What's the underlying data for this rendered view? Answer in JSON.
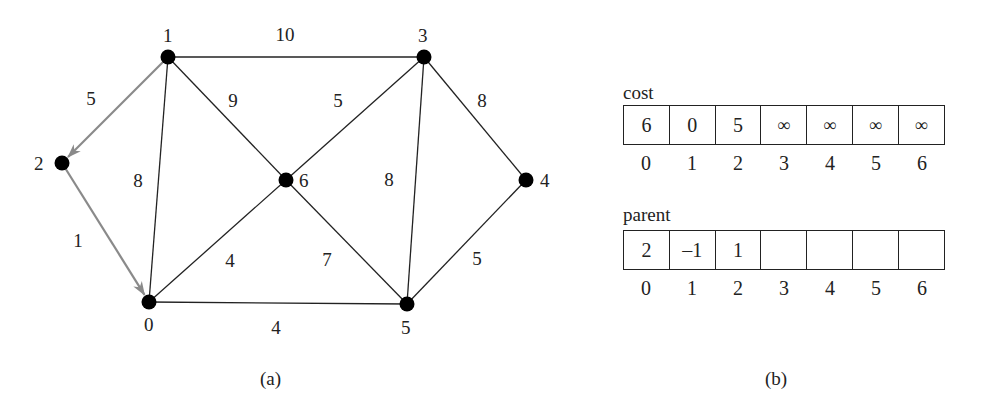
{
  "figure": {
    "part_a": {
      "caption": "(a)",
      "nodes": [
        {
          "id": "0",
          "label": "0",
          "x": 149,
          "y": 302,
          "lx": 144,
          "ly": 331
        },
        {
          "id": "1",
          "label": "1",
          "x": 168,
          "y": 57,
          "lx": 163,
          "ly": 42
        },
        {
          "id": "2",
          "label": "2",
          "x": 62,
          "y": 163,
          "lx": 34,
          "ly": 170
        },
        {
          "id": "3",
          "label": "3",
          "x": 424,
          "y": 57,
          "lx": 418,
          "ly": 42
        },
        {
          "id": "4",
          "label": "4",
          "x": 526,
          "y": 180,
          "lx": 540,
          "ly": 187
        },
        {
          "id": "5",
          "label": "5",
          "x": 407,
          "y": 304,
          "lx": 401,
          "ly": 334
        },
        {
          "id": "6",
          "label": "6",
          "x": 286,
          "y": 180,
          "lx": 299,
          "ly": 187
        }
      ],
      "edges": [
        {
          "from": "1",
          "to": "3",
          "weight": "10",
          "tree": false,
          "wx": 285,
          "wy": 41
        },
        {
          "from": "1",
          "to": "2",
          "weight": "5",
          "tree": true,
          "directed": true,
          "wx": 91,
          "wy": 105
        },
        {
          "from": "1",
          "to": "6",
          "weight": "9",
          "tree": false,
          "wx": 233,
          "wy": 107
        },
        {
          "from": "1",
          "to": "0",
          "weight": "8",
          "tree": false,
          "wx": 138,
          "wy": 187
        },
        {
          "from": "2",
          "to": "0",
          "weight": "1",
          "tree": true,
          "directed": true,
          "wx": 78,
          "wy": 247
        },
        {
          "from": "3",
          "to": "6",
          "weight": "5",
          "tree": false,
          "wx": 338,
          "wy": 107
        },
        {
          "from": "3",
          "to": "5",
          "weight": "8",
          "tree": false,
          "wx": 389,
          "wy": 186
        },
        {
          "from": "3",
          "to": "4",
          "weight": "8",
          "tree": false,
          "wx": 482,
          "wy": 107
        },
        {
          "from": "6",
          "to": "0",
          "weight": "4",
          "tree": false,
          "wx": 230,
          "wy": 267
        },
        {
          "from": "6",
          "to": "5",
          "weight": "7",
          "tree": false,
          "wx": 327,
          "wy": 266
        },
        {
          "from": "4",
          "to": "5",
          "weight": "5",
          "tree": false,
          "wx": 477,
          "wy": 265
        },
        {
          "from": "0",
          "to": "5",
          "weight": "4",
          "tree": false,
          "wx": 276,
          "wy": 334
        }
      ]
    },
    "part_b": {
      "caption": "(b)",
      "cost": {
        "label": "cost",
        "values": [
          "6",
          "0",
          "5",
          "∞",
          "∞",
          "∞",
          "∞"
        ],
        "indices": [
          "0",
          "1",
          "2",
          "3",
          "4",
          "5",
          "6"
        ]
      },
      "parent": {
        "label": "parent",
        "values": [
          "2",
          "–1",
          "1",
          "",
          "",
          "",
          ""
        ],
        "indices": [
          "0",
          "1",
          "2",
          "3",
          "4",
          "5",
          "6"
        ]
      }
    },
    "colors": {
      "edge": "#222222",
      "tree_edge": "#8a8a8a",
      "node": "#000000"
    }
  }
}
